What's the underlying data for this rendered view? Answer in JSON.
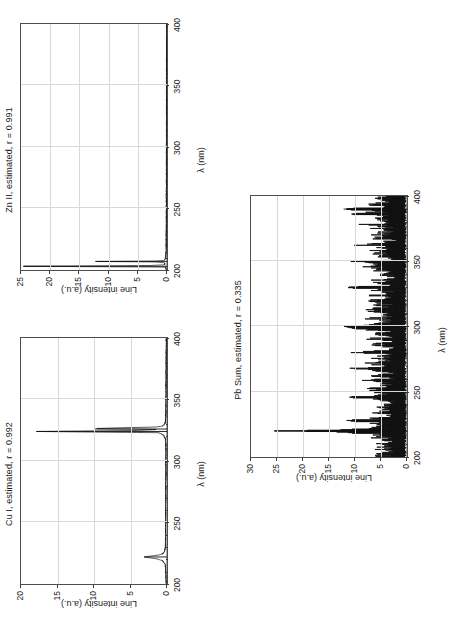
{
  "figure": {
    "background": "#ffffff",
    "line_color": "#111111",
    "grid_color": "#d8d8d8",
    "axis_color": "#4d4d4d",
    "orientation": "rotated-90-counterclockwise"
  },
  "panels": [
    {
      "id": "zn",
      "title": "Zn II, estimated, r = 0.991",
      "xlabel": "λ (nm)",
      "ylabel": "Line intensity (a.u.)",
      "xticks": [
        "200",
        "250",
        "300",
        "350",
        "400"
      ],
      "yticks": [
        "0",
        "5",
        "10",
        "15",
        "20",
        "25"
      ]
    },
    {
      "id": "cu",
      "title": "Cu I, estimated, r = 0.992",
      "xlabel": "λ (nm)",
      "ylabel": "Line intensity (a.u.)",
      "xticks": [
        "200",
        "250",
        "300",
        "350",
        "400"
      ],
      "yticks": [
        "0",
        "5",
        "10",
        "15",
        "20"
      ]
    },
    {
      "id": "pb",
      "title": "Pb Sum, estimated, r = 0.335",
      "xlabel": "λ (nm)",
      "ylabel": "Line intensity (a.u.)",
      "xticks": [
        "200",
        "250",
        "300",
        "350",
        "400"
      ],
      "yticks": [
        "0",
        "5",
        "10",
        "15",
        "20",
        "25",
        "30"
      ]
    }
  ],
  "chart_data": [
    {
      "type": "line",
      "id": "zn",
      "title": "Zn II, estimated, r = 0.991",
      "xlabel": "λ (nm)",
      "ylabel": "Line intensity (a.u.)",
      "xlim": [
        200,
        400
      ],
      "ylim": [
        0,
        25
      ],
      "xticks": [
        200,
        250,
        300,
        350,
        400
      ],
      "yticks": [
        0,
        5,
        10,
        15,
        20,
        25
      ],
      "grid": true,
      "legend": "none",
      "annotation": "r = 0.991",
      "series": [
        {
          "name": "Zn II estimated spectrum",
          "comment": "Near-zero baseline with two strong UV lines just above 200 nm; sparse low noise elsewhere.",
          "x": [
            200.0,
            200.6,
            201.2,
            201.8,
            202.4,
            203.0,
            203.6,
            204.2,
            204.8,
            205.4,
            206.0,
            206.6,
            206.9,
            207.2,
            207.8,
            208.4,
            209.0,
            209.6,
            210.0,
            210.5,
            211.0,
            212.0,
            213.0,
            214.0,
            215.0,
            216.0,
            218.0,
            220.0,
            222.0,
            225.0,
            228.0,
            230.0,
            233.0,
            236.0,
            240.0,
            244.0,
            248.0,
            252.0,
            256.0,
            260.0,
            264.0,
            268.0,
            272.0,
            276.0,
            280.0,
            284.0,
            288.0,
            292.0,
            296.0,
            300.0,
            304.0,
            308.0,
            312.0,
            316.0,
            320.0,
            324.0,
            328.0,
            332.0,
            336.0,
            340.0,
            344.0,
            348.0,
            352.0,
            356.0,
            360.0,
            364.0,
            368.0,
            372.0,
            376.0,
            380.0,
            384.0,
            388.0,
            392.0,
            396.0,
            400.0
          ],
          "y": [
            0.1,
            0.12,
            0.15,
            0.2,
            0.3,
            24.6,
            3.1,
            0.4,
            0.3,
            0.35,
            0.6,
            2.2,
            12.3,
            2.0,
            0.5,
            0.35,
            0.3,
            0.28,
            0.25,
            0.22,
            0.2,
            0.18,
            0.17,
            0.16,
            0.15,
            0.15,
            0.14,
            0.13,
            0.13,
            0.12,
            0.12,
            0.12,
            0.11,
            0.11,
            0.11,
            0.1,
            0.1,
            0.1,
            0.1,
            0.1,
            0.1,
            0.09,
            0.09,
            0.09,
            0.09,
            0.09,
            0.09,
            0.09,
            0.09,
            0.08,
            0.08,
            0.08,
            0.08,
            0.08,
            0.08,
            0.08,
            0.08,
            0.08,
            0.08,
            0.07,
            0.07,
            0.07,
            0.07,
            0.07,
            0.07,
            0.07,
            0.07,
            0.07,
            0.07,
            0.06,
            0.06,
            0.06,
            0.06,
            0.06,
            0.06
          ]
        }
      ],
      "peaks": [
        {
          "wavelength": 203,
          "intensity": 24.6
        },
        {
          "wavelength": 207,
          "intensity": 12.3
        }
      ]
    },
    {
      "type": "line",
      "id": "cu",
      "title": "Cu I, estimated, r = 0.992",
      "xlabel": "λ (nm)",
      "ylabel": "Line intensity (a.u.)",
      "xlim": [
        200,
        400
      ],
      "ylim": [
        0,
        20
      ],
      "xticks": [
        200,
        250,
        300,
        350,
        400
      ],
      "yticks": [
        0,
        5,
        10,
        15,
        20
      ],
      "grid": true,
      "legend": "none",
      "annotation": "r = 0.992",
      "series": [
        {
          "name": "Cu I estimated spectrum",
          "comment": "Dominant line near 324-327 nm reaching ~18 a.u., secondary line at ~222 nm (~3 a.u.), low baseline noise.",
          "x": [
            200.0,
            204.0,
            208.0,
            212.0,
            216.0,
            219.0,
            220.5,
            221.5,
            222.0,
            222.6,
            223.5,
            224.5,
            226.0,
            228.0,
            230.0,
            234.0,
            238.0,
            242.0,
            246.0,
            250.0,
            254.0,
            258.0,
            262.0,
            266.0,
            270.0,
            274.0,
            278.0,
            282.0,
            286.0,
            290.0,
            294.0,
            298.0,
            302.0,
            306.0,
            310.0,
            314.0,
            318.0,
            321.0,
            323.0,
            324.0,
            324.8,
            325.6,
            326.4,
            327.0,
            327.6,
            328.4,
            330.0,
            332.0,
            336.0,
            340.0,
            344.0,
            348.0,
            352.0,
            356.0,
            360.0,
            364.0,
            368.0,
            372.0,
            376.0,
            380.0,
            384.0,
            388.0,
            392.0,
            396.0,
            400.0
          ],
          "y": [
            0.1,
            0.12,
            0.14,
            0.18,
            0.25,
            0.6,
            1.4,
            2.6,
            3.1,
            2.4,
            1.2,
            0.6,
            0.35,
            0.25,
            0.22,
            0.2,
            0.19,
            0.18,
            0.18,
            0.17,
            0.17,
            0.16,
            0.16,
            0.16,
            0.15,
            0.15,
            0.15,
            0.15,
            0.14,
            0.14,
            0.14,
            0.14,
            0.14,
            0.13,
            0.13,
            0.13,
            0.2,
            0.45,
            1.1,
            17.9,
            4.2,
            1.3,
            9.9,
            6.4,
            1.5,
            0.6,
            0.3,
            0.2,
            0.15,
            0.14,
            0.13,
            0.13,
            0.12,
            0.12,
            0.12,
            0.11,
            0.11,
            0.11,
            0.1,
            0.1,
            0.1,
            0.1,
            0.09,
            0.09,
            0.09
          ]
        }
      ],
      "peaks": [
        {
          "wavelength": 324,
          "intensity": 17.9
        },
        {
          "wavelength": 326,
          "intensity": 9.9
        },
        {
          "wavelength": 222,
          "intensity": 3.1
        }
      ]
    },
    {
      "type": "line",
      "id": "pb",
      "title": "Pb Sum, estimated, r = 0.335",
      "xlabel": "λ (nm)",
      "ylabel": "Line intensity (a.u.)",
      "xlim": [
        200,
        400
      ],
      "ylim": [
        0,
        30
      ],
      "xticks": [
        200,
        250,
        300,
        350,
        400
      ],
      "yticks": [
        0,
        5,
        10,
        15,
        20,
        25,
        30
      ],
      "grid": true,
      "legend": "none",
      "annotation": "r = 0.335",
      "series": [
        {
          "name": "Pb Sum estimated spectrum",
          "comment": "Dense noisy forest of lines 0-10 a.u. across 200-400 nm, with one dominant line near 220 nm at ~25.5 a.u. and secondary lines near 300 nm (~12) and 390 nm (~12).",
          "noise_band": [
            0.5,
            10.0
          ],
          "x": [
            200,
            202,
            204,
            206,
            208,
            210,
            212,
            214,
            216,
            218,
            219,
            220,
            221,
            222,
            224,
            226,
            228,
            230,
            232,
            234,
            236,
            238,
            240,
            242,
            244,
            246,
            248,
            250,
            252,
            254,
            256,
            258,
            260,
            262,
            264,
            266,
            268,
            270,
            272,
            274,
            276,
            278,
            280,
            282,
            284,
            286,
            288,
            290,
            292,
            294,
            296,
            298,
            300,
            302,
            304,
            306,
            308,
            310,
            312,
            314,
            316,
            318,
            320,
            322,
            324,
            326,
            328,
            330,
            332,
            334,
            336,
            338,
            340,
            342,
            344,
            346,
            348,
            350,
            352,
            354,
            356,
            358,
            360,
            362,
            364,
            366,
            368,
            370,
            372,
            374,
            376,
            378,
            380,
            382,
            384,
            386,
            388,
            390,
            392,
            394,
            396,
            398,
            400
          ],
          "y": [
            6.2,
            8.1,
            4.5,
            9.3,
            5.0,
            7.4,
            3.8,
            8.8,
            6.0,
            10.1,
            12.0,
            25.5,
            11.2,
            9.4,
            5.6,
            8.2,
            11.6,
            6.9,
            4.2,
            7.8,
            5.4,
            9.0,
            6.4,
            3.9,
            8.4,
            11.4,
            5.1,
            7.2,
            9.6,
            4.8,
            6.6,
            10.3,
            5.9,
            8.0,
            4.4,
            7.0,
            11.0,
            6.1,
            8.6,
            4.9,
            7.6,
            5.3,
            10.8,
            6.8,
            4.1,
            8.3,
            5.7,
            9.2,
            6.3,
            7.9,
            4.6,
            9.8,
            12.1,
            7.1,
            5.2,
            8.7,
            6.0,
            4.3,
            9.5,
            6.7,
            7.3,
            5.5,
            10.0,
            6.2,
            8.9,
            4.7,
            7.7,
            11.8,
            5.8,
            9.1,
            6.5,
            4.0,
            8.5,
            7.4,
            5.6,
            9.9,
            6.9,
            11.3,
            4.5,
            8.1,
            6.3,
            7.8,
            5.0,
            10.6,
            6.6,
            4.2,
            9.4,
            7.2,
            5.4,
            8.3,
            6.1,
            10.2,
            4.8,
            7.6,
            5.9,
            11.0,
            8.0,
            12.2,
            6.4,
            9.3,
            5.1,
            7.5,
            4.4
          ]
        }
      ],
      "peaks": [
        {
          "wavelength": 220,
          "intensity": 25.5
        },
        {
          "wavelength": 300,
          "intensity": 12.1
        },
        {
          "wavelength": 390,
          "intensity": 12.2
        }
      ]
    }
  ]
}
